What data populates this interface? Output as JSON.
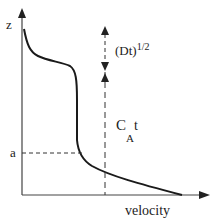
{
  "diagram": {
    "y_axis_label": "z",
    "x_axis_label": "velocity",
    "height_marker_label": "a",
    "diffusion_label_base": "(Dt)",
    "diffusion_label_exp": "1/2",
    "concentration_label_main": "C",
    "concentration_label_sub": "A",
    "concentration_label_t": "t",
    "colors": {
      "line": "#1a1a1a",
      "axis": "#444444",
      "background": "#ffffff"
    }
  }
}
